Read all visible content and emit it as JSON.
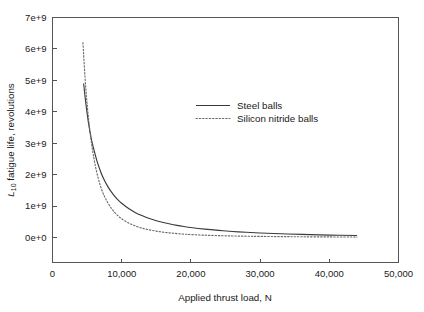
{
  "chart_data": {
    "type": "line",
    "title": "",
    "xlabel": "Applied thrust load, N",
    "ylabel": "L10 fatigue life, revolutions",
    "ylabel_parts": {
      "symbol": "L",
      "subscript": "10",
      "rest": " fatigue life, revolutions"
    },
    "xlim": [
      0,
      50000
    ],
    "ylim": [
      0,
      7000000000
    ],
    "grid": false,
    "legend_position": "center",
    "x_ticks": [
      0,
      10000,
      20000,
      30000,
      40000,
      50000
    ],
    "x_tick_labels": [
      "0",
      "10,000",
      "20,000",
      "30,000",
      "40,000",
      "50,000"
    ],
    "y_ticks": [
      0,
      1000000000,
      2000000000,
      3000000000,
      4000000000,
      5000000000,
      6000000000,
      7000000000
    ],
    "y_tick_labels": [
      "0e+0",
      "1e+9",
      "2e+9",
      "3e+9",
      "4e+9",
      "5e+9",
      "6e+9",
      "7e+9"
    ],
    "series": [
      {
        "name": "Steel balls",
        "style": "solid",
        "color": "#3a3a3a",
        "x": [
          4500,
          4800,
          5200,
          5600,
          6000,
          6500,
          7000,
          7500,
          8000,
          8500,
          9000,
          9500,
          10000,
          11000,
          12000,
          13000,
          14000,
          15000,
          16000,
          17000,
          18000,
          19000,
          20000,
          22000,
          24000,
          26000,
          28000,
          30000,
          33000,
          36000,
          40000,
          44000
        ],
        "y": [
          4900000000,
          4300000000,
          3650000000,
          3150000000,
          2780000000,
          2380000000,
          2070000000,
          1820000000,
          1620000000,
          1450000000,
          1310000000,
          1190000000,
          1090000000,
          920000000,
          790000000,
          690000000,
          605000000,
          535000000,
          478000000,
          428000000,
          386000000,
          350000000,
          318000000,
          266000000,
          225000000,
          192000000,
          166000000,
          144000000,
          118000000,
          98000000,
          77000000,
          62000000
        ]
      },
      {
        "name": "Silicon nitride balls",
        "style": "dotted",
        "color": "#6b6b6b",
        "x": [
          4400,
          4700,
          5000,
          5400,
          5800,
          6200,
          6600,
          7000,
          7500,
          8000,
          8500,
          9000,
          9500,
          10000,
          11000,
          12000,
          13000,
          14000,
          15000,
          16000,
          17000,
          18000,
          19000,
          20000,
          22000,
          24000,
          26000,
          28000,
          30000,
          33000,
          36000,
          40000,
          44000
        ],
        "y": [
          6200000000,
          5100000000,
          4250000000,
          3400000000,
          2760000000,
          2270000000,
          1890000000,
          1590000000,
          1310000000,
          1100000000,
          930000000,
          795000000,
          685000000,
          595000000,
          460000000,
          365000000,
          295000000,
          242000000,
          202000000,
          170000000,
          145000000,
          125000000,
          108000000,
          95000000,
          74000000,
          60000000,
          49000000,
          41000000,
          35000000,
          28000000,
          23000000,
          18000000,
          14000000
        ]
      }
    ]
  },
  "legend": {
    "entries": [
      {
        "label": "Steel balls"
      },
      {
        "label": "Silicon nitride balls"
      }
    ]
  }
}
